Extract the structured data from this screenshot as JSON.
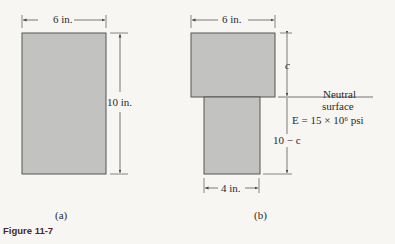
{
  "figure": {
    "caption": "Figure 11-7",
    "colors": {
      "fill": "#c2c2c0",
      "stroke": "#555555",
      "background": "#f7f6f2"
    },
    "panel_a": {
      "label": "(a)",
      "width_label": "6 in.",
      "height_label": "10 in."
    },
    "panel_b": {
      "label": "(b)",
      "top_width_label": "6 in.",
      "bottom_width_label": "4 in.",
      "top_depth_label": "c",
      "bottom_depth_label": "10 − c",
      "neutral_line1": "Neutral",
      "neutral_line2": "surface",
      "modulus_label": "E = 15 × 10⁶ psi"
    }
  }
}
